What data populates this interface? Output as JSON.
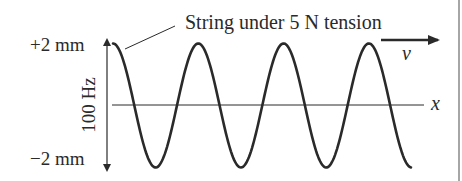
{
  "diagram": {
    "caption": "String under 5 N tension",
    "amplitude_top_label": "+2 mm",
    "amplitude_bottom_label": "−2 mm",
    "frequency_label": "100 Hz",
    "velocity_label": "v",
    "axis_label": "x",
    "wave": {
      "amplitude_mm": 2,
      "frequency_hz": 100,
      "tension_n": 5,
      "cycles_shown": 3.5
    },
    "colors": {
      "ink": "#2a2a2a",
      "background": "#ffffff",
      "frame": "#888888"
    }
  }
}
